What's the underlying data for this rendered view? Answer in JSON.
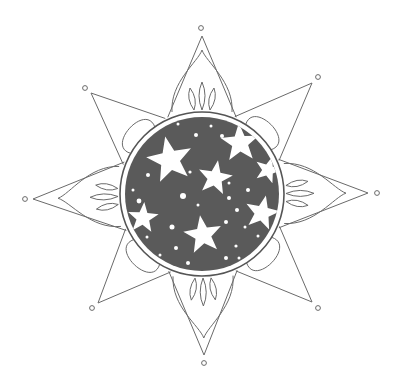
{
  "illustration": {
    "subject": "eight-point star compass mandala with starry night disc",
    "style": "coloring-page line art",
    "colors": {
      "background": "#ffffff",
      "line": "#6a6a6a",
      "disc": "#5a5a5a",
      "stars": "#ffffff"
    },
    "center": [
      202,
      194
    ],
    "disc_radius": 77,
    "ring_radius": 82,
    "points": [
      {
        "name": "north",
        "tip": [
          202,
          36
        ],
        "dot": [
          201,
          28
        ]
      },
      {
        "name": "northeast",
        "tip": [
          312,
          83
        ],
        "dot": [
          318,
          77
        ]
      },
      {
        "name": "east",
        "tip": [
          368,
          193
        ],
        "dot": [
          377,
          193
        ]
      },
      {
        "name": "southeast",
        "tip": [
          312,
          302
        ],
        "dot": [
          318,
          308
        ]
      },
      {
        "name": "south",
        "tip": [
          204,
          355
        ],
        "dot": [
          204,
          363
        ]
      },
      {
        "name": "southwest",
        "tip": [
          98,
          303
        ],
        "dot": [
          92,
          308
        ]
      },
      {
        "name": "west",
        "tip": [
          33,
          199
        ],
        "dot": [
          25,
          199
        ]
      },
      {
        "name": "northwest",
        "tip": [
          91,
          93
        ],
        "dot": [
          85,
          88
        ]
      }
    ],
    "stars": [
      {
        "cx": 170,
        "cy": 160,
        "r": 24
      },
      {
        "cx": 215,
        "cy": 178,
        "r": 18
      },
      {
        "cx": 240,
        "cy": 143,
        "r": 20
      },
      {
        "cx": 268,
        "cy": 170,
        "r": 14
      },
      {
        "cx": 143,
        "cy": 218,
        "r": 16
      },
      {
        "cx": 203,
        "cy": 235,
        "r": 20
      },
      {
        "cx": 262,
        "cy": 213,
        "r": 18
      }
    ]
  }
}
